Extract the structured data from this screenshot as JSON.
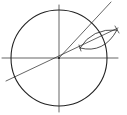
{
  "diagram": {
    "type": "geometric-construction",
    "colors": {
      "stroke": "#222222",
      "background": "#ffffff"
    },
    "circle": {
      "cx": 59,
      "cy": 58,
      "r": 48
    },
    "axes": {
      "horizontal": {
        "x1": 2,
        "y1": 58,
        "x2": 118,
        "y2": 58
      },
      "vertical": {
        "x1": 59,
        "y1": 5,
        "x2": 59,
        "y2": 112
      }
    },
    "rays": [
      {
        "name": "steep-ray",
        "x1": 59,
        "y1": 58,
        "x2": 111,
        "y2": 2
      },
      {
        "name": "shallow-line",
        "x1": 6,
        "y1": 81,
        "x2": 118,
        "y2": 28
      }
    ],
    "lens": {
      "left_point": {
        "x": 80,
        "y": 48
      },
      "right_point": {
        "x": 117,
        "y": 30
      }
    }
  }
}
